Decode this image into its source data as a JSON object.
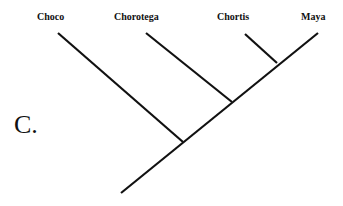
{
  "diagram": {
    "panel_letter": "C.",
    "type": "cladogram",
    "line_color": "#111111",
    "taxa": [
      {
        "name": "Choco"
      },
      {
        "name": "Chorotega"
      },
      {
        "name": "Chortis"
      },
      {
        "name": "Maya"
      }
    ],
    "topology": "(Choco,(Chorotega,(Chortis,Maya)))"
  }
}
